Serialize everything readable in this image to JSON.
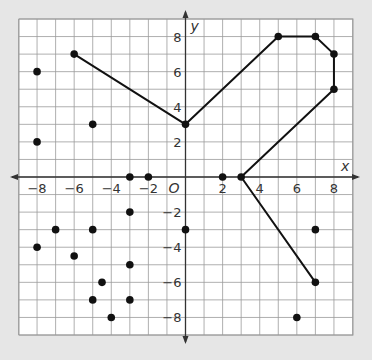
{
  "chart_data": {
    "type": "scatter",
    "title": "",
    "xlabel": "x",
    "ylabel": "y",
    "origin_label": "O",
    "xlim": [
      -9,
      9
    ],
    "ylim": [
      -9,
      9
    ],
    "grid": true,
    "x_ticks": [
      -8,
      -6,
      -4,
      -2,
      2,
      4,
      6,
      8
    ],
    "y_ticks": [
      8,
      6,
      4,
      2,
      -2,
      -4,
      -6,
      -8
    ],
    "polyline": [
      [
        -6,
        7
      ],
      [
        0,
        3
      ],
      [
        5,
        8
      ],
      [
        7,
        8
      ],
      [
        8,
        7
      ],
      [
        8,
        5
      ],
      [
        3,
        0
      ],
      [
        7,
        -6
      ]
    ],
    "points": [
      [
        -8,
        6
      ],
      [
        -8,
        2
      ],
      [
        -5,
        3
      ],
      [
        -3,
        0
      ],
      [
        -2,
        0
      ],
      [
        2,
        0
      ],
      [
        0,
        -3
      ],
      [
        -3,
        -2
      ],
      [
        -7,
        -3
      ],
      [
        -5,
        -3
      ],
      [
        -8,
        -4
      ],
      [
        -6,
        -4.5
      ],
      [
        -3,
        -5
      ],
      [
        -4.5,
        -6
      ],
      [
        -5,
        -7
      ],
      [
        -3,
        -7
      ],
      [
        -4,
        -8
      ],
      [
        7,
        -3
      ],
      [
        6,
        -8
      ]
    ],
    "colors": {
      "background": "#e6e6e6",
      "grid_bg": "#ffffff",
      "grid": "#9a9a9a",
      "ink": "#111111"
    }
  }
}
